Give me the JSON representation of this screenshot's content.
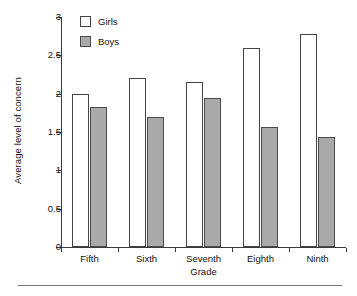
{
  "chart_data": {
    "type": "bar",
    "title": "",
    "xlabel": "Grade",
    "ylabel": "Average level of concern",
    "categories": [
      "Fifth",
      "Sixth",
      "Seventh",
      "Eighth",
      "Ninth"
    ],
    "series": [
      {
        "name": "Girls",
        "values": [
          2.0,
          2.2,
          2.15,
          2.6,
          2.78
        ],
        "color": "#ffffff"
      },
      {
        "name": "Boys",
        "values": [
          1.83,
          1.7,
          1.95,
          1.57,
          1.44
        ],
        "color": "#a9a9a9"
      }
    ],
    "ylim": [
      0,
      3
    ],
    "yticks": [
      0,
      0.5,
      1,
      1.5,
      2,
      2.5,
      3
    ],
    "ytick_labels": [
      "0",
      "0.5",
      "1",
      "1.5",
      "2",
      "2.5",
      "3"
    ],
    "grid": false,
    "legend_position": "top-left",
    "legend": [
      "Girls",
      "Boys"
    ]
  },
  "axes": {
    "y_title": "Average level of concern",
    "x_title": "Grade"
  },
  "colors": {
    "girls_fill": "#ffffff",
    "boys_fill": "#a9a9a9",
    "outline": "#444444",
    "axis": "#3b3b3b",
    "rule": "#777777"
  }
}
